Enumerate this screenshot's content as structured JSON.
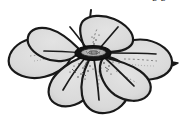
{
  "figure": {
    "kind": "botanical-line-drawing",
    "view": "oblique-top",
    "technique": "ink outline with gray wash and stippling",
    "background_color": "#ffffff",
    "petal_fill_color": "#dcdcdc",
    "petal_fill_shadow_color": "#c9c9c9",
    "outline_color": "#1a1a1a",
    "center_ring_color": "#141414",
    "center_inner_color": "#cfcfcf",
    "stipple_color": "#3a3a3a",
    "vein_color": "#555555",
    "outline_width": "2.2",
    "petal_count": 7,
    "petals": [
      {
        "name": "petal-top",
        "label": "upper petal"
      },
      {
        "name": "petal-upper-left",
        "label": "upper left petal"
      },
      {
        "name": "petal-left",
        "label": "left petal"
      },
      {
        "name": "petal-lower-left",
        "label": "lower left petal"
      },
      {
        "name": "petal-bottom",
        "label": "bottom petal"
      },
      {
        "name": "petal-lower-right",
        "label": "lower right petal"
      },
      {
        "name": "petal-right",
        "label": "right petal"
      }
    ],
    "center": {
      "name": "flower-center",
      "label": "corolla throat",
      "shape": "ellipse",
      "cx": 93,
      "cy": 53,
      "rx": 18,
      "ry": 7
    },
    "stem": {
      "name": "stem",
      "label": "pedicel stub",
      "visible": true
    }
  },
  "annotations": {
    "corner_mark": "pp"
  }
}
